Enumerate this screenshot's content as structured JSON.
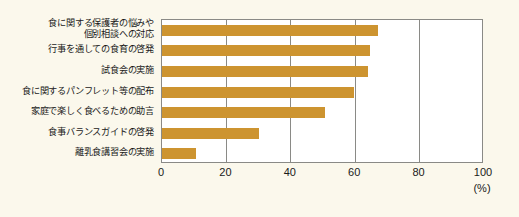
{
  "chart_data": {
    "type": "bar",
    "orientation": "horizontal",
    "title": "",
    "xlabel": "(%)",
    "ylabel": "",
    "xlim": [
      0,
      100
    ],
    "xticks": [
      0,
      20,
      40,
      60,
      80,
      100
    ],
    "grid": true,
    "legend": false,
    "bar_color": "#cd9430",
    "categories": [
      "食に関する保護者の悩みや\n個別相談への対応",
      "行事を通しての食育の啓発",
      "試食会の実施",
      "食に関するパンフレット等の配布",
      "家庭で楽しく食べるための助言",
      "食事バランスガイドの啓発",
      "離乳食講習会の実施"
    ],
    "values": [
      67,
      64.5,
      64,
      59.5,
      50.5,
      30,
      10.5
    ]
  },
  "axis": {
    "unit": "(%)",
    "tick_labels": [
      "0",
      "20",
      "40",
      "60",
      "80",
      "100"
    ]
  },
  "colors": {
    "bar": "#cd9430",
    "frame": "#8a8a86",
    "background": "#fbf8ec",
    "plot_background": "#ffffff",
    "text": "#1a1a1a"
  }
}
